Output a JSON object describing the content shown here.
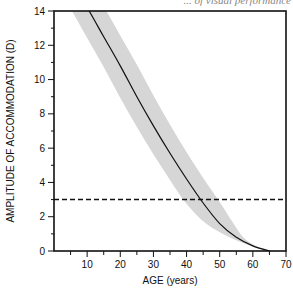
{
  "caption": "... of visual performance",
  "chart_data": {
    "type": "line",
    "title": "",
    "xlabel": "AGE (years)",
    "ylabel": "AMPLITUDE OF ACCOMMODATION (D)",
    "xlim": [
      0,
      70
    ],
    "ylim": [
      0,
      14
    ],
    "x_ticks": [
      10,
      20,
      30,
      40,
      50,
      60,
      70
    ],
    "x_minor_step": 5,
    "y_ticks": [
      0,
      2,
      4,
      6,
      8,
      10,
      12,
      14
    ],
    "y_minor_step": 1,
    "grid": false,
    "series": [
      {
        "name": "mean amplitude",
        "x": [
          10.6,
          15,
          20,
          25,
          30,
          35,
          40,
          45,
          50,
          55,
          60,
          65
        ],
        "values": [
          14.0,
          12.5,
          10.8,
          9.0,
          7.3,
          5.7,
          4.2,
          2.8,
          1.6,
          0.8,
          0.3,
          0.0
        ]
      }
    ],
    "band": {
      "name": "range (shaded)",
      "color": "#d6d6d6",
      "x_offset_years": 5.2
    },
    "reference_line": {
      "y": 3,
      "style": "dashed",
      "label": ""
    }
  }
}
